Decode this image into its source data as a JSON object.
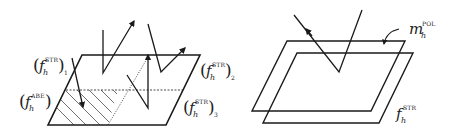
{
  "figure": {
    "left_panel": {
      "labels": [
        {
          "id": "str-1",
          "base": "f",
          "subscript": "h",
          "superscript": "STR",
          "index": "1",
          "x": 33,
          "y": 71
        },
        {
          "id": "str-2",
          "base": "f",
          "subscript": "h",
          "superscript": "STR",
          "index": "2",
          "x": 200,
          "y": 76
        },
        {
          "id": "abs",
          "base": "f",
          "subscript": "h",
          "superscript": "ABE",
          "index": "",
          "x": 19,
          "y": 107
        },
        {
          "id": "str-3",
          "base": "f",
          "subscript": "h",
          "superscript": "STR",
          "index": "3",
          "x": 183,
          "y": 113
        }
      ]
    },
    "right_panel": {
      "labels": [
        {
          "id": "m-pol",
          "base": "m",
          "subscript": "h",
          "superscript": "POL",
          "x": 409,
          "y": 34
        },
        {
          "id": "f-str",
          "base": "f",
          "subscript": "h",
          "superscript": "STR",
          "x": 396,
          "y": 119
        }
      ]
    },
    "colors": {
      "stroke": "#1a1a1a",
      "background": "#ffffff"
    }
  }
}
